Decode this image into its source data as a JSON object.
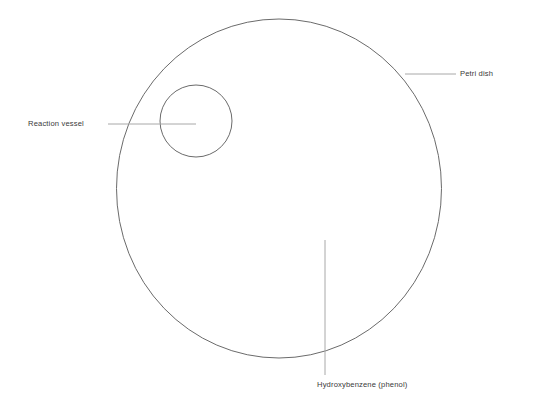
{
  "diagram": {
    "canvas": {
      "width": 533,
      "height": 409,
      "background": "#ffffff"
    },
    "colors": {
      "outline": "#6b6b6b",
      "leader_line": "#a8a8a8",
      "label_text": "#3a3a3a",
      "background": "#ffffff"
    },
    "shapes": {
      "petri_dish": {
        "name": "petri-dish",
        "type": "ellipse",
        "cx": 279,
        "cy": 188.5,
        "rx": 162.5,
        "ry": 169.5,
        "stroke": "#6b6b6b",
        "stroke_width": 1,
        "fill": "none"
      },
      "reaction_vessel": {
        "name": "reaction-vessel",
        "type": "circle",
        "cx": 196,
        "cy": 121,
        "r": 36,
        "stroke": "#6b6b6b",
        "stroke_width": 1,
        "fill": "none"
      }
    },
    "leaders": [
      {
        "name": "petri-dish-leader",
        "x1": 405,
        "y1": 74,
        "x2": 456,
        "y2": 74,
        "stroke": "#a8a8a8"
      },
      {
        "name": "reaction-vessel-leader",
        "x1": 108,
        "y1": 124,
        "x2": 196,
        "y2": 124,
        "stroke": "#a8a8a8"
      },
      {
        "name": "phenol-leader",
        "x1": 325,
        "y1": 240,
        "x2": 325,
        "y2": 375,
        "stroke": "#a8a8a8"
      }
    ],
    "labels": [
      {
        "id": "petri_dish",
        "text": "Petri dish"
      },
      {
        "id": "reaction_vessel",
        "text": "Reaction vessel"
      },
      {
        "id": "phenol",
        "text": "Hydroxybenzene (phenol)"
      }
    ]
  }
}
